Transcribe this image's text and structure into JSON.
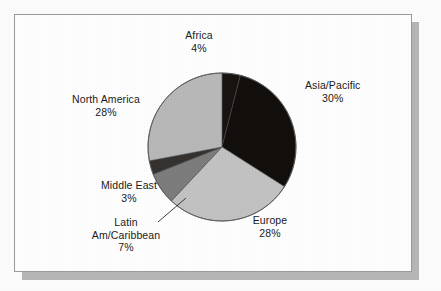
{
  "figure": {
    "frame": {
      "border_color": "#9a9a9a",
      "background_color": "#ffffff",
      "shadow_color": "#b6b6b6"
    }
  },
  "chart_data": {
    "type": "pie",
    "title": "",
    "subtitle": "",
    "xlabel": "",
    "ylabel": "",
    "legend_position": "none",
    "grid": false,
    "labels_show_percent": true,
    "start_angle_deg": 0,
    "direction": "clockwise",
    "center": {
      "x": 222,
      "y": 147
    },
    "radius": 74,
    "categories": [
      "Africa",
      "Asia/Pacific",
      "Europe",
      "Latin Am/Caribbean",
      "Middle East",
      "North America"
    ],
    "values": [
      4,
      30,
      28,
      7,
      3,
      28
    ],
    "units": "%",
    "slices": [
      {
        "name": "Africa",
        "label": "Africa",
        "value": 4,
        "percent_text": "4%",
        "color": "#171412",
        "start_deg": 0,
        "end_deg": 14.4
      },
      {
        "name": "Asia/Pacific",
        "label": "Asia/Pacific",
        "value": 30,
        "percent_text": "30%",
        "color": "#120f0d",
        "start_deg": 14.4,
        "end_deg": 122.4
      },
      {
        "name": "Europe",
        "label": "Europe",
        "value": 28,
        "percent_text": "28%",
        "color": "#c3c3c3",
        "start_deg": 122.4,
        "end_deg": 223.2
      },
      {
        "name": "Latin Am/Caribbean",
        "label_line1": "Latin",
        "label_line2": "Am/Caribbean",
        "value": 7,
        "percent_text": "7%",
        "color": "#7d7d7d",
        "start_deg": 223.2,
        "end_deg": 248.4,
        "has_leader_line": true
      },
      {
        "name": "Middle East",
        "label": "Middle East",
        "value": 3,
        "percent_text": "3%",
        "color": "#35322f",
        "start_deg": 248.4,
        "end_deg": 259.2
      },
      {
        "name": "North America",
        "label": "North America",
        "value": 28,
        "percent_text": "28%",
        "color": "#b9b9b9",
        "start_deg": 259.2,
        "end_deg": 360
      }
    ]
  }
}
